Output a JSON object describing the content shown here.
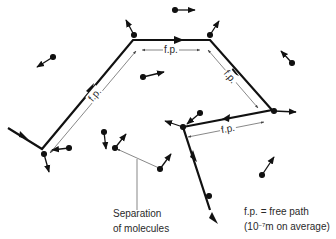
{
  "diagram": {
    "path_label": "f.p.",
    "separation_label_line1": "Separation",
    "separation_label_line2": "of molecules",
    "legend_line1": "f.p. = free path",
    "legend_line2_prefix": "(10",
    "legend_line2_exponent": "−7",
    "legend_line2_suffix": "m on average)",
    "colors": {
      "path": "#111111",
      "molecule": "#111111",
      "dimension_line": "#555555",
      "text": "#2a2a2a",
      "background": "#ffffff"
    },
    "path_points": [
      [
        8,
        128
      ],
      [
        42,
        149
      ],
      [
        133,
        40
      ],
      [
        210,
        40
      ],
      [
        272,
        110
      ],
      [
        183,
        127
      ],
      [
        210,
        210
      ]
    ],
    "molecules": [
      {
        "x": 53,
        "y": 57,
        "dx": 37,
        "dy": 67
      },
      {
        "x": 134,
        "y": 35,
        "dx": 126,
        "dy": 20
      },
      {
        "x": 175,
        "y": 10,
        "dx": 195,
        "dy": 10
      },
      {
        "x": 210,
        "y": 35,
        "dx": 219,
        "dy": 21
      },
      {
        "x": 292,
        "y": 63,
        "dx": 281,
        "dy": 51
      },
      {
        "x": 143,
        "y": 77,
        "dx": 164,
        "dy": 72
      },
      {
        "x": 44,
        "y": 154,
        "dx": 49,
        "dy": 172
      },
      {
        "x": 69,
        "y": 148,
        "dx": 52,
        "dy": 150
      },
      {
        "x": 104,
        "y": 132,
        "dx": 106,
        "dy": 149
      },
      {
        "x": 115,
        "y": 168,
        "dx": 128,
        "dy": 153
      },
      {
        "x": 160,
        "y": 189,
        "dx": 171,
        "dy": 174
      },
      {
        "x": 183,
        "y": 127,
        "dx": 165,
        "dy": 121
      },
      {
        "x": 200,
        "y": 113,
        "dx": 187,
        "dy": 124
      },
      {
        "x": 274,
        "y": 111,
        "dx": 296,
        "dy": 112
      },
      {
        "x": 262,
        "y": 175,
        "dx": 274,
        "dy": 157
      },
      {
        "x": 208,
        "y": 196,
        "dx": 216,
        "dy": 214
      }
    ]
  }
}
